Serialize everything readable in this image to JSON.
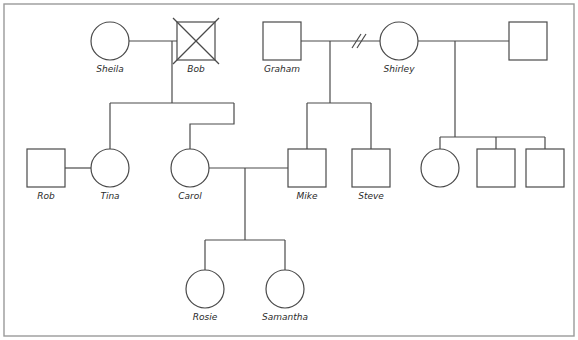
{
  "diagram": {
    "type": "genogram",
    "canvas": {
      "width": 578,
      "height": 340
    },
    "colors": {
      "stroke": "#4a4a4a",
      "label": "#2b2b2b",
      "border": "#9a9a9a",
      "background": "#ffffff"
    },
    "symbols": {
      "male": "square",
      "female": "circle",
      "deceased": "x-cross-over-shape",
      "divorced": "double-slash-on-union-line"
    },
    "persons": [
      {
        "id": "sheila",
        "label": "Sheila",
        "sex": "female",
        "shape": "circle",
        "cx": 110,
        "cy": 41,
        "r": 19,
        "deceased": false,
        "generation": 1
      },
      {
        "id": "bob",
        "label": "Bob",
        "sex": "male",
        "shape": "square",
        "cx": 196,
        "cy": 41,
        "size": 38,
        "deceased": true,
        "generation": 1
      },
      {
        "id": "graham",
        "label": "Graham",
        "sex": "male",
        "shape": "square",
        "cx": 282,
        "cy": 41,
        "size": 38,
        "deceased": false,
        "generation": 1
      },
      {
        "id": "shirley",
        "label": "Shirley",
        "sex": "female",
        "shape": "circle",
        "cx": 399,
        "cy": 41,
        "r": 19,
        "deceased": false,
        "generation": 1
      },
      {
        "id": "partner2",
        "label": "",
        "sex": "male",
        "shape": "square",
        "cx": 528,
        "cy": 41,
        "size": 38,
        "deceased": false,
        "generation": 1
      },
      {
        "id": "rob",
        "label": "Rob",
        "sex": "male",
        "shape": "square",
        "cx": 46,
        "cy": 168,
        "size": 38,
        "deceased": false,
        "generation": 2
      },
      {
        "id": "tina",
        "label": "Tina",
        "sex": "female",
        "shape": "circle",
        "cx": 110,
        "cy": 168,
        "r": 19,
        "deceased": false,
        "generation": 2
      },
      {
        "id": "carol",
        "label": "Carol",
        "sex": "female",
        "shape": "circle",
        "cx": 190,
        "cy": 168,
        "r": 19,
        "deceased": false,
        "generation": 2
      },
      {
        "id": "mike",
        "label": "Mike",
        "sex": "male",
        "shape": "square",
        "cx": 307,
        "cy": 168,
        "size": 38,
        "deceased": false,
        "generation": 2
      },
      {
        "id": "steve",
        "label": "Steve",
        "sex": "male",
        "shape": "square",
        "cx": 371,
        "cy": 168,
        "size": 38,
        "deceased": false,
        "generation": 2
      },
      {
        "id": "child_r1",
        "label": "",
        "sex": "female",
        "shape": "circle",
        "cx": 440,
        "cy": 168,
        "r": 19,
        "deceased": false,
        "generation": 2
      },
      {
        "id": "child_r2",
        "label": "",
        "sex": "male",
        "shape": "square",
        "cx": 496,
        "cy": 168,
        "size": 38,
        "deceased": false,
        "generation": 2
      },
      {
        "id": "child_r3",
        "label": "",
        "sex": "male",
        "shape": "square",
        "cx": 545,
        "cy": 168,
        "size": 38,
        "deceased": false,
        "generation": 2
      },
      {
        "id": "rosie",
        "label": "Rosie",
        "sex": "female",
        "shape": "circle",
        "cx": 205,
        "cy": 289,
        "r": 19,
        "deceased": false,
        "generation": 3
      },
      {
        "id": "samantha",
        "label": "Samantha",
        "sex": "female",
        "shape": "circle",
        "cx": 285,
        "cy": 289,
        "r": 19,
        "deceased": false,
        "generation": 3
      }
    ],
    "unions": [
      {
        "id": "u_sheila_bob",
        "partners": [
          "sheila",
          "bob"
        ],
        "status": "married",
        "children": [
          "tina",
          "carol"
        ]
      },
      {
        "id": "u_graham_shirley",
        "partners": [
          "graham",
          "shirley"
        ],
        "status": "divorced",
        "children": [
          "mike",
          "steve"
        ]
      },
      {
        "id": "u_shirley_partner2",
        "partners": [
          "shirley",
          "partner2"
        ],
        "status": "married",
        "children": [
          "child_r1",
          "child_r2",
          "child_r3"
        ]
      },
      {
        "id": "u_rob_tina",
        "partners": [
          "rob",
          "tina"
        ],
        "status": "married",
        "children": []
      },
      {
        "id": "u_carol_mike",
        "partners": [
          "carol",
          "mike"
        ],
        "status": "married",
        "children": [
          "rosie",
          "samantha"
        ]
      }
    ],
    "labels": {
      "sheila": "Sheila",
      "bob": "Bob",
      "graham": "Graham",
      "shirley": "Shirley",
      "rob": "Rob",
      "tina": "Tina",
      "carol": "Carol",
      "mike": "Mike",
      "steve": "Steve",
      "rosie": "Rosie",
      "samantha": "Samantha"
    }
  }
}
